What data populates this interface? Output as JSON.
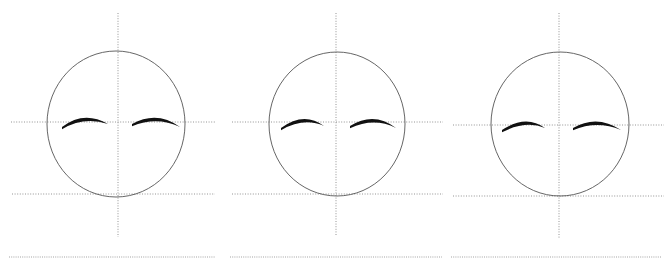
{
  "figure": {
    "title": "",
    "background_color": "#ffffff",
    "width": 670,
    "height": 267,
    "panel_count": 3
  },
  "style": {
    "guide_line_color": "#888888",
    "circle_stroke_color": "#555555",
    "arc_color": "#111111",
    "baseline_color": "#999999",
    "guide_dash": "1,1.6",
    "circle_stroke_width": 0.9,
    "guide_stroke_width": 0.9,
    "baseline_stroke_width": 0.9
  },
  "panels": [
    {
      "id": "panel-1",
      "label": "Face construction panel 1",
      "x_offset": 0,
      "head": {
        "cx": 116,
        "cy": 124,
        "rx": 69,
        "ry": 73
      },
      "vertical_guide": {
        "x": 118,
        "y1": 13,
        "y2": 237
      },
      "eye_line": {
        "y": 122,
        "x1": 11,
        "x2": 215
      },
      "jaw_line": {
        "y": 194,
        "x1": 12,
        "x2": 215
      },
      "baseline": {
        "y": 257,
        "x1": 9,
        "x2": 215
      },
      "brow_left": {
        "x1": 62,
        "y1": 127,
        "cx": 84,
        "cy": 113,
        "x2": 108,
        "y2": 124
      },
      "brow_right": {
        "x1": 132,
        "y1": 124,
        "cx": 157,
        "cy": 113,
        "x2": 180,
        "y2": 127
      }
    },
    {
      "id": "panel-2",
      "label": "Face construction panel 2",
      "x_offset": 224,
      "head": {
        "cx": 113,
        "cy": 124,
        "rx": 68,
        "ry": 72
      },
      "vertical_guide": {
        "x": 112,
        "y1": 13,
        "y2": 235
      },
      "eye_line": {
        "y": 122,
        "x1": 8,
        "x2": 219
      },
      "jaw_line": {
        "y": 194,
        "x1": 8,
        "x2": 219
      },
      "baseline": {
        "y": 257,
        "x1": 6,
        "x2": 218
      },
      "brow_left": {
        "x1": 57,
        "y1": 128,
        "cx": 80,
        "cy": 114,
        "x2": 100,
        "y2": 126
      },
      "brow_right": {
        "x1": 126,
        "y1": 126,
        "cx": 150,
        "cy": 114,
        "x2": 172,
        "y2": 128
      }
    },
    {
      "id": "panel-3",
      "label": "Face construction panel 3",
      "x_offset": 446,
      "head": {
        "cx": 114,
        "cy": 124,
        "rx": 69,
        "ry": 72
      },
      "vertical_guide": {
        "x": 113,
        "y1": 13,
        "y2": 238
      },
      "eye_line": {
        "y": 125,
        "x1": 7,
        "x2": 218
      },
      "jaw_line": {
        "y": 196,
        "x1": 7,
        "x2": 218
      },
      "baseline": {
        "y": 257,
        "x1": 5,
        "x2": 216
      },
      "brow_left": {
        "x1": 56,
        "y1": 130,
        "cx": 80,
        "cy": 117,
        "x2": 99,
        "y2": 128
      },
      "brow_right": {
        "x1": 127,
        "y1": 128,
        "cx": 151,
        "cy": 117,
        "x2": 175,
        "y2": 130
      }
    }
  ]
}
